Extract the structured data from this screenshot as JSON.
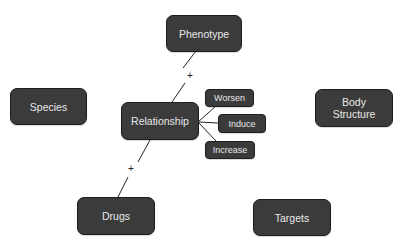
{
  "diagram": {
    "nodes": {
      "phenotype": "Phenotype",
      "species": "Species",
      "relationship": "Relationship",
      "body_structure_line1": "Body",
      "body_structure_line2": "Structure",
      "worsen": "Worsen",
      "induce": "Induce",
      "increase": "Increase",
      "drugs": "Drugs",
      "targets": "Targets"
    },
    "edge_labels": {
      "phenotype_relationship": "+",
      "relationship_drugs": "+"
    },
    "colors": {
      "node_fill": "#3b3b3b",
      "node_border": "#1e1e1e",
      "node_text": "#e8e8e8",
      "edge": "#222222",
      "background": "#ffffff"
    }
  }
}
